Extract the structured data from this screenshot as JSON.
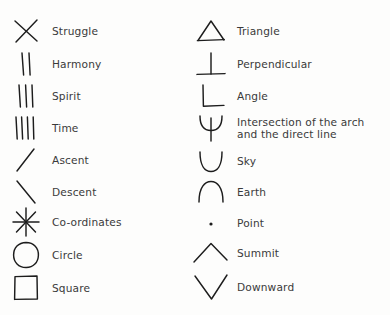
{
  "document": {
    "type": "symbol-legend",
    "background_color": "#fdfdfc",
    "ink_color": "#1d1d1d",
    "text_color": "#3a3a3a",
    "columns": 2,
    "rows_per_column": 10
  },
  "left_column": {
    "entries": [
      {
        "icon": "cross-x-icon",
        "label": "Struggle"
      },
      {
        "icon": "two-vertical-lines-icon",
        "label": "Harmony"
      },
      {
        "icon": "three-vertical-lines-icon",
        "label": "Spirit"
      },
      {
        "icon": "four-vertical-lines-icon",
        "label": "Time"
      },
      {
        "icon": "rising-diagonal-line-icon",
        "label": "Ascent"
      },
      {
        "icon": "falling-diagonal-line-icon",
        "label": "Descent"
      },
      {
        "icon": "asterisk-star-icon",
        "label": "Co-ordinates"
      },
      {
        "icon": "circle-icon",
        "label": "Circle"
      },
      {
        "icon": "square-icon",
        "label": "Square"
      }
    ]
  },
  "right_column": {
    "entries": [
      {
        "icon": "triangle-icon",
        "label": "Triangle"
      },
      {
        "icon": "perpendicular-tee-icon",
        "label": "Perpendicular"
      },
      {
        "icon": "right-angle-icon",
        "label": "Angle"
      },
      {
        "icon": "arch-intersection-icon",
        "label": "Intersection of the arch\nand the direct line"
      },
      {
        "icon": "cup-arc-up-icon",
        "label": "Sky"
      },
      {
        "icon": "dome-arc-down-icon",
        "label": "Earth"
      },
      {
        "icon": "dot-point-icon",
        "label": "Point"
      },
      {
        "icon": "chevron-up-summit-icon",
        "label": "Summit"
      },
      {
        "icon": "chevron-down-icon",
        "label": "Downward"
      }
    ]
  }
}
